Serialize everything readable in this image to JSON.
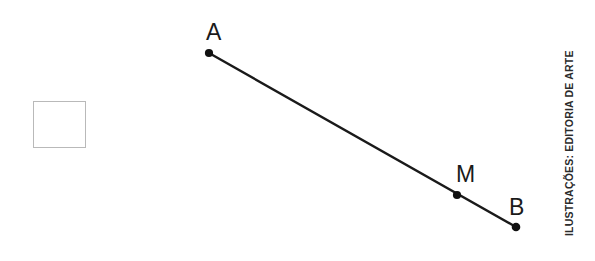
{
  "figure": {
    "type": "geometry-line-segment-diagram",
    "stroke_color": "#1a1a1a",
    "background_color": "#ffffff",
    "segment": {
      "from": "A",
      "to": "B",
      "midpoint_marker": "M"
    },
    "points": [
      {
        "label": "A",
        "x": 209,
        "y": 53
      },
      {
        "label": "M",
        "x": 457,
        "y": 195
      },
      {
        "label": "B",
        "x": 516,
        "y": 227
      }
    ],
    "labels": {
      "a": "A",
      "m": "M",
      "b": "B"
    }
  },
  "answer_box": {
    "value": "",
    "placeholder": "",
    "border_color": "#b9b9b9"
  },
  "credit": {
    "text": "ILUSTRAÇÕES: EDITORIA DE ARTE",
    "color": "#2b2b2b"
  }
}
